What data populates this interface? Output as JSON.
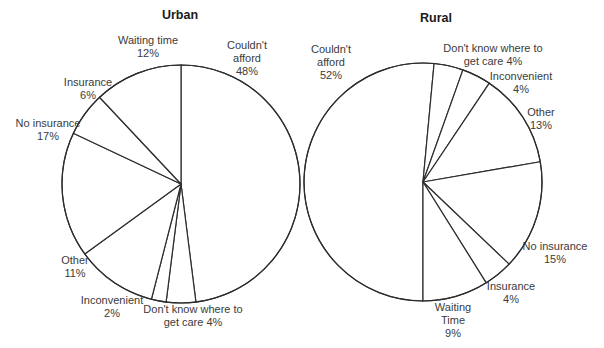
{
  "figure": {
    "background": "#ffffff",
    "stroke_color": "#2d2d2d",
    "text_color": "#3b3b3b",
    "title_color": "#1a1a1a"
  },
  "chart_data": [
    {
      "type": "pie",
      "title": "Urban",
      "units": "percent",
      "direction": "clockwise",
      "start_angle_deg": 0,
      "layout": {
        "cx": 181,
        "cy": 184,
        "r": 119
      },
      "slices": [
        {
          "label": "Couldn't afford",
          "value": 48,
          "label_lines": [
            "Couldn't",
            "afford",
            "48%"
          ],
          "label_x": 247,
          "label_y": 39
        },
        {
          "label": "Don't know where to get care",
          "value": 4,
          "label_lines": [
            "Don't know where to",
            "get care 4%"
          ],
          "label_x": 193,
          "label_y": 303
        },
        {
          "label": "Inconvenient",
          "value": 2,
          "label_lines": [
            "Inconvenient",
            "2%"
          ],
          "label_x": 112,
          "label_y": 294
        },
        {
          "label": "Other",
          "value": 11,
          "label_lines": [
            "Other",
            "11%"
          ],
          "label_x": 75,
          "label_y": 254
        },
        {
          "label": "No insurance",
          "value": 17,
          "label_lines": [
            "No insurance",
            "17%"
          ],
          "label_x": 48,
          "label_y": 117
        },
        {
          "label": "Insurance",
          "value": 6,
          "label_lines": [
            "Insurance",
            "6%"
          ],
          "label_x": 88,
          "label_y": 76
        },
        {
          "label": "Waiting time",
          "value": 12,
          "label_lines": [
            "Waiting time",
            "12%"
          ],
          "label_x": 148,
          "label_y": 34
        }
      ]
    },
    {
      "type": "pie",
      "title": "Rural",
      "units": "percent",
      "direction": "clockwise",
      "start_angle_deg": 180,
      "layout": {
        "cx": 423,
        "cy": 182,
        "r": 119
      },
      "slices": [
        {
          "label": "Couldn't afford",
          "value": 52,
          "label_lines": [
            "Couldn't",
            "afford",
            "52%"
          ],
          "label_x": 331,
          "label_y": 43
        },
        {
          "label": "Don't know where to get care",
          "value": 4,
          "label_lines": [
            "Don't know where to",
            "get care 4%"
          ],
          "label_x": 493,
          "label_y": 42
        },
        {
          "label": "Inconvenient",
          "value": 4,
          "label_lines": [
            "Inconvenient",
            "4%"
          ],
          "label_x": 521,
          "label_y": 70
        },
        {
          "label": "Other",
          "value": 13,
          "label_lines": [
            "Other",
            "13%"
          ],
          "label_x": 541,
          "label_y": 106
        },
        {
          "label": "No insurance",
          "value": 15,
          "label_lines": [
            "No insurance",
            "15%"
          ],
          "label_x": 555,
          "label_y": 240
        },
        {
          "label": "Insurance",
          "value": 4,
          "label_lines": [
            "Insurance",
            "4%"
          ],
          "label_x": 511,
          "label_y": 280
        },
        {
          "label": "Waiting Time",
          "value": 9,
          "label_lines": [
            "Waiting",
            "Time",
            "9%"
          ],
          "label_x": 453,
          "label_y": 301
        }
      ]
    }
  ]
}
